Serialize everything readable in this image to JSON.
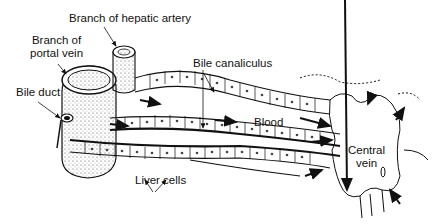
{
  "diagram": {
    "labels": {
      "hepatic_artery": "Branch of hepatic artery",
      "portal_vein_line1": "Branch of",
      "portal_vein_line2": "portal vein",
      "bile_duct": "Bile duct",
      "bile_canaliculus": "Bile canaliculus",
      "blood": "Blood",
      "central_vein_line1": "Central",
      "central_vein_line2": "vein",
      "liver_cells": "Liver cells"
    },
    "colors": {
      "ink": "#111111",
      "background": "#ffffff",
      "stipple": "#888888"
    }
  }
}
